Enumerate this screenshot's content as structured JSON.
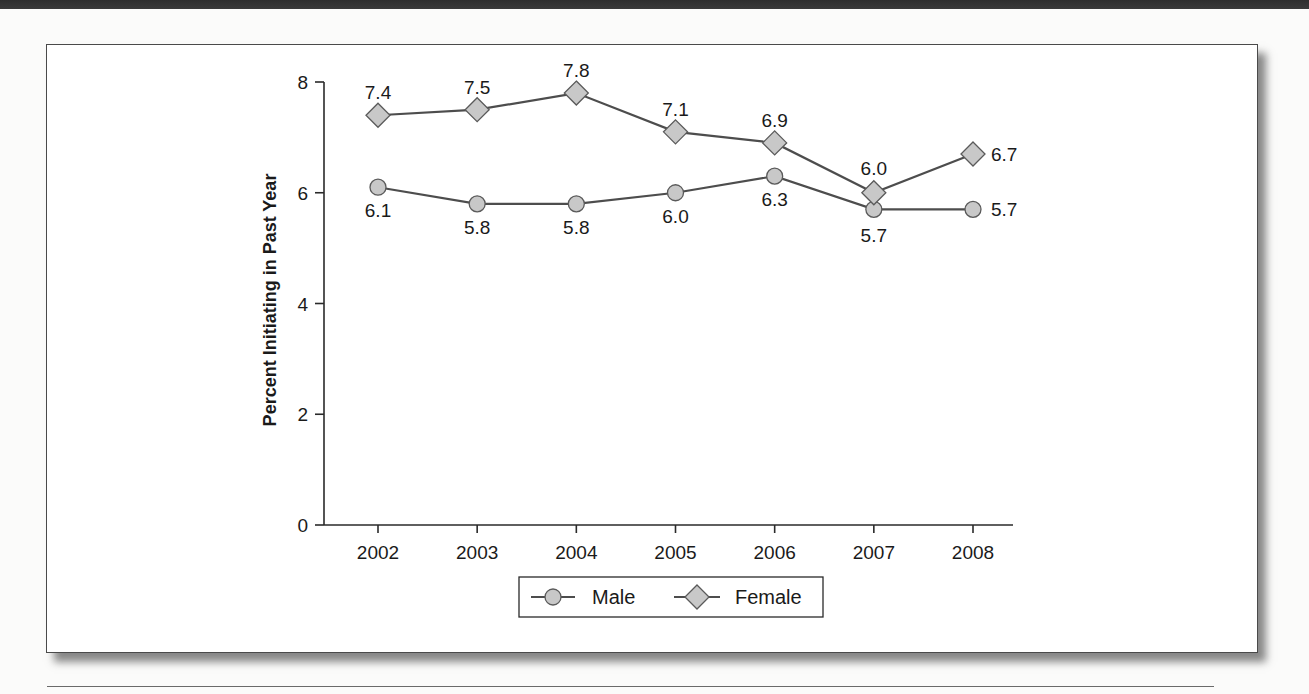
{
  "chart_data": {
    "type": "line",
    "title": "",
    "xlabel": "",
    "ylabel": "Percent Initiating in Past Year",
    "categories": [
      "2002",
      "2003",
      "2004",
      "2005",
      "2006",
      "2007",
      "2008"
    ],
    "series": [
      {
        "name": "Male",
        "marker": "circle",
        "values": [
          6.1,
          5.8,
          5.8,
          6.0,
          6.3,
          5.7,
          5.7
        ]
      },
      {
        "name": "Female",
        "marker": "diamond",
        "values": [
          7.4,
          7.5,
          7.8,
          7.1,
          6.9,
          6.0,
          6.7
        ]
      }
    ],
    "ylim": [
      0,
      8
    ],
    "yticks": [
      0,
      2,
      4,
      6,
      8
    ],
    "grid": false,
    "legend_position": "bottom-center"
  },
  "colors": {
    "line": "#4d4d4d",
    "marker_fill": "#c8c8c8",
    "marker_stroke": "#5a5a5a",
    "frame": "#4a4a4a"
  }
}
